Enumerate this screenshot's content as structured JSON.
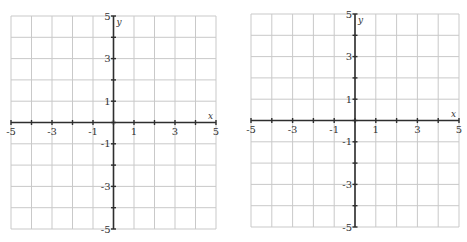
{
  "chart_data": [
    {
      "type": "scatter",
      "title": "",
      "xlabel": "x",
      "ylabel": "y",
      "xlim": [
        -5,
        5
      ],
      "ylim": [
        -5,
        5
      ],
      "grid": true,
      "grid_step": 1,
      "x_tick_labels": [
        "-5",
        "-3",
        "-1",
        "1",
        "3",
        "5"
      ],
      "y_tick_labels": [
        "5",
        "3",
        "1",
        "-1",
        "-3",
        "-5"
      ],
      "series": [],
      "box": {
        "left": 11,
        "right": 216,
        "top": 16,
        "bottom": 229
      }
    },
    {
      "type": "scatter",
      "title": "",
      "xlabel": "x",
      "ylabel": "y",
      "xlim": [
        -5,
        5
      ],
      "ylim": [
        -5,
        5
      ],
      "grid": true,
      "grid_step": 1,
      "x_tick_labels": [
        "-5",
        "-3",
        "-1",
        "1",
        "3",
        "5"
      ],
      "y_tick_labels": [
        "5",
        "3",
        "1",
        "-1",
        "-3",
        "-5"
      ],
      "series": [],
      "box": {
        "left": 251,
        "right": 459,
        "top": 14,
        "bottom": 227
      }
    }
  ],
  "colors": {
    "grid": "#c9c9c9",
    "axis": "#2e2e2e",
    "text": "#333333"
  }
}
